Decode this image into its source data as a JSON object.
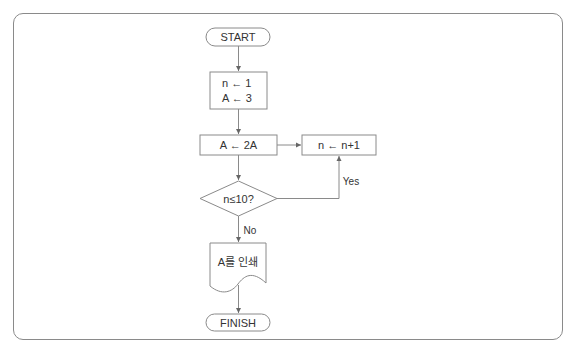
{
  "diagram": {
    "type": "flowchart",
    "nodes": {
      "start": {
        "shape": "terminator",
        "label": "START"
      },
      "init": {
        "shape": "process",
        "lines": [
          "n ← 1",
          "A ← 3"
        ]
      },
      "double": {
        "shape": "process",
        "label": "A ← 2A"
      },
      "increment": {
        "shape": "process",
        "label": "n ← n+1"
      },
      "condition": {
        "shape": "decision",
        "label": "n≤10?"
      },
      "print": {
        "shape": "document",
        "label": "A를 인쇄"
      },
      "finish": {
        "shape": "terminator",
        "label": "FINISH"
      }
    },
    "edges": [
      {
        "from": "start",
        "to": "init",
        "label": ""
      },
      {
        "from": "init",
        "to": "double",
        "label": ""
      },
      {
        "from": "double",
        "to": "increment",
        "label": ""
      },
      {
        "from": "double",
        "to": "condition",
        "label": ""
      },
      {
        "from": "condition",
        "to": "increment",
        "label": "Yes"
      },
      {
        "from": "condition",
        "to": "print",
        "label": "No"
      },
      {
        "from": "print",
        "to": "finish",
        "label": ""
      }
    ],
    "edge_labels": {
      "yes": "Yes",
      "no": "No"
    },
    "colors": {
      "stroke": "#8a8a8a",
      "text": "#333333",
      "frame": "#8a8a8a"
    }
  }
}
